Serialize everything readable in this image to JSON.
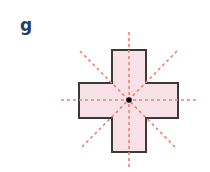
{
  "figure": {
    "label": "g",
    "shape": "cross (plus sign)",
    "colors": {
      "fill": "#f9e2e7",
      "stroke": "#3a3a3a",
      "symmetry_lines": "#f0806f",
      "center_dot": "#000000",
      "label": "#23405f"
    },
    "symmetry_lines_count": 4,
    "center": [
      129,
      100
    ]
  }
}
